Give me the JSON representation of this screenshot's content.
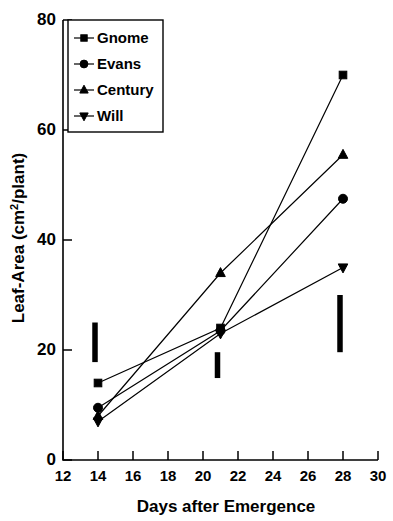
{
  "chart_data": {
    "type": "line",
    "title": "",
    "xlabel": "Days after Emergence",
    "ylabel": "Leaf-Area (cm2/plant)",
    "ylabel_parts": {
      "prefix": "Leaf-Area (cm",
      "superscript": "2",
      "suffix": "/plant)"
    },
    "x": [
      14,
      21,
      28
    ],
    "xlim": [
      12,
      30
    ],
    "ylim": [
      0,
      80
    ],
    "xticks": [
      12,
      14,
      16,
      18,
      20,
      22,
      24,
      26,
      28,
      30
    ],
    "yticks": [
      0,
      20,
      40,
      60,
      80
    ],
    "grid": false,
    "legend_position": "top-left-inside",
    "series": [
      {
        "name": "Gnome",
        "marker": "square",
        "values": [
          14.0,
          24.0,
          70.0
        ]
      },
      {
        "name": "Evans",
        "marker": "circle",
        "values": [
          9.5,
          23.5,
          47.5
        ]
      },
      {
        "name": "Century",
        "marker": "triangle-up",
        "values": [
          8.0,
          34.0,
          55.5
        ]
      },
      {
        "name": "Will",
        "marker": "triangle-down",
        "values": [
          7.0,
          23.0,
          35.0
        ]
      }
    ],
    "error_bars": [
      {
        "x": 14,
        "low": 17.8,
        "high": 25.0
      },
      {
        "x": 21,
        "low": 14.9,
        "high": 19.6
      },
      {
        "x": 28,
        "low": 19.6,
        "high": 30.0
      }
    ]
  },
  "legend": {
    "items": [
      {
        "label": "Gnome",
        "marker": "square"
      },
      {
        "label": "Evans",
        "marker": "circle"
      },
      {
        "label": "Century",
        "marker": "triangle-up"
      },
      {
        "label": "Will",
        "marker": "triangle-down"
      }
    ]
  }
}
